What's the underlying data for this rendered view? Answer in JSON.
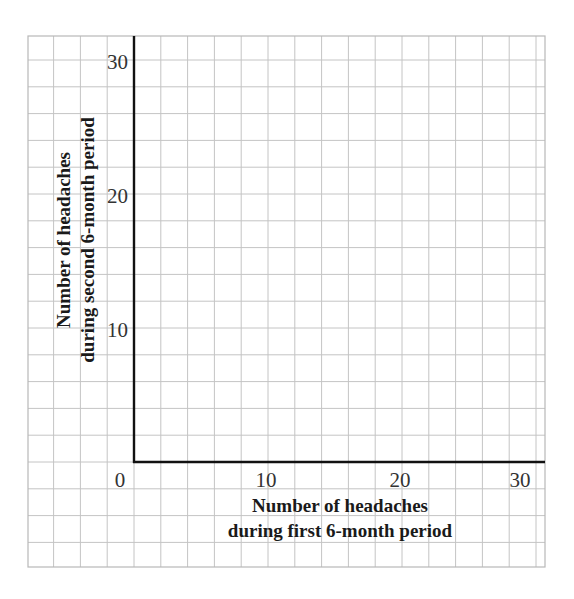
{
  "chart_data": {
    "type": "scatter",
    "title": "",
    "xlabel": "Number of headaches during first 6-month period",
    "ylabel": "Number of headaches during second 6-month period",
    "xlabel_lines": [
      "Number of headaches",
      "during first 6-month period"
    ],
    "ylabel_lines": [
      "Number of headaches",
      "during second 6-month period"
    ],
    "xlim": [
      0,
      30
    ],
    "ylim": [
      0,
      30
    ],
    "x_ticks": [
      "0",
      "10",
      "20",
      "30"
    ],
    "y_ticks": [
      "10",
      "20",
      "30"
    ],
    "grid": true,
    "grid_step": 2,
    "series": [],
    "note": "Blank graph-paper grid with axes; no data points plotted"
  },
  "colors": {
    "grid": "#c4c4c4",
    "axis": "#111111",
    "background": "#ffffff"
  }
}
